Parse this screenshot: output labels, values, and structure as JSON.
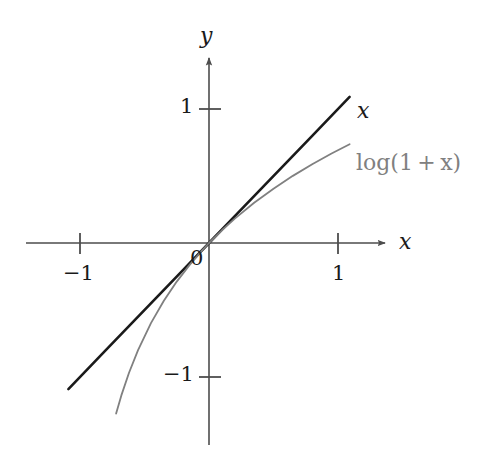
{
  "figure": {
    "width": 484,
    "height": 460,
    "background": "#ffffff"
  },
  "axes": {
    "x_name": "x",
    "y_name": "y",
    "origin_label": "0",
    "x_ticks": [
      {
        "value": -1,
        "label": "−1"
      },
      {
        "value": 1,
        "label": "1"
      }
    ],
    "y_ticks": [
      {
        "value": 1,
        "label": "1"
      },
      {
        "value": -1,
        "label": "−1"
      }
    ]
  },
  "chart_data": {
    "type": "line",
    "title": "",
    "xlabel": "x",
    "ylabel": "y",
    "xlim": [
      -1.42,
      1.38
    ],
    "ylim": [
      -1.55,
      1.38
    ],
    "grid": false,
    "legend": "inline-at-curve-end",
    "x_ticks": [
      -1,
      1
    ],
    "y_ticks": [
      -1,
      1
    ],
    "origin_label": "0",
    "series": [
      {
        "name": "x",
        "label": "x",
        "color": "#1a1a1a",
        "width": 2.6,
        "x": [
          -1.09,
          -0.8,
          -0.6,
          -0.4,
          -0.2,
          0,
          0.2,
          0.4,
          0.6,
          0.8,
          1.09
        ],
        "values": [
          -1.09,
          -0.8,
          -0.6,
          -0.4,
          -0.2,
          0,
          0.2,
          0.4,
          0.6,
          0.8,
          1.09
        ]
      },
      {
        "name": "log(1+x)",
        "label": "log(1 + x)",
        "color": "#808080",
        "width": 1.8,
        "x": [
          -0.72,
          -0.68,
          -0.62,
          -0.55,
          -0.45,
          -0.35,
          -0.25,
          -0.15,
          -0.05,
          0,
          0.1,
          0.2,
          0.35,
          0.5,
          0.65,
          0.8,
          0.95,
          1.09
        ],
        "values": [
          -1.273,
          -1.139,
          -0.968,
          -0.799,
          -0.598,
          -0.431,
          -0.288,
          -0.163,
          -0.051,
          0,
          0.095,
          0.182,
          0.3,
          0.405,
          0.501,
          0.588,
          0.668,
          0.737
        ]
      }
    ],
    "annotations": [
      {
        "text": "x",
        "at": [
          1.13,
          0.99
        ],
        "color": "#1a1a1a"
      },
      {
        "text": "log(1 + x)",
        "at": [
          1.14,
          0.58
        ],
        "color": "#808080"
      }
    ]
  },
  "labels": {
    "curve_x": "x",
    "curve_log": "log(1 + x)",
    "tick_x_neg1": "−1",
    "tick_x_pos1": "1",
    "tick_y_pos1": "1",
    "tick_y_neg1": "−1",
    "origin": "0",
    "axis_x": "x",
    "axis_y": "y"
  },
  "colors": {
    "line": "#1a1a1a",
    "log_curve": "#808080",
    "axis": "#4d4d4d",
    "text": "#1a1a1a"
  }
}
